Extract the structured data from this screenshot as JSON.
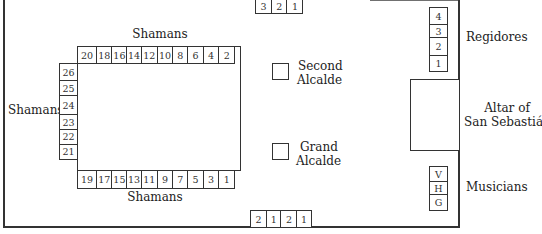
{
  "diagram": {
    "type": "seating-plan",
    "top_door_seats": [
      "3",
      "2",
      "1"
    ],
    "bottom_door_seats": [
      "2",
      "1",
      "2",
      "1"
    ],
    "shamans": {
      "top_label": "Shamans",
      "left_label": "Shamans",
      "bottom_label": "Shamans",
      "top_row": [
        "20",
        "18",
        "16",
        "14",
        "12",
        "10",
        "8",
        "6",
        "4",
        "2"
      ],
      "left_column": [
        "26",
        "25",
        "24",
        "23",
        "22",
        "21"
      ],
      "bottom_row": [
        "19",
        "17",
        "15",
        "13",
        "11",
        "9",
        "7",
        "5",
        "3",
        "1"
      ]
    },
    "second_alcalde": {
      "line1": "Second",
      "line2": "Alcalde"
    },
    "grand_alcalde": {
      "line1": "Grand",
      "line2": "Alcalde"
    },
    "regidores": {
      "label": "Regidores",
      "seats": [
        "4",
        "3",
        "2",
        "1"
      ]
    },
    "altar": {
      "line1": "Altar of",
      "line2": "San Sebastián"
    },
    "musicians": {
      "label": "Musicians",
      "seats": [
        "V",
        "H",
        "G"
      ]
    }
  }
}
